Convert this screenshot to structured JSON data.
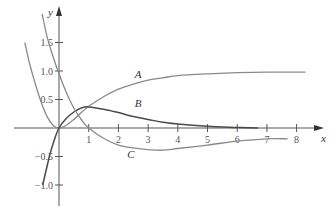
{
  "chart_data": {
    "type": "line",
    "title": "",
    "xlabel": "x",
    "ylabel": "y",
    "xlim": [
      -1.2,
      8.8
    ],
    "ylim": [
      -1.3,
      2.2
    ],
    "grid": false,
    "legend": "inline labels",
    "x_ticks": [
      1,
      2,
      3,
      4,
      5,
      6,
      7,
      8
    ],
    "x_tick_labels": [
      "1",
      "2",
      "3",
      "4",
      "5",
      "6",
      "7",
      "8"
    ],
    "y_ticks": [
      1.5,
      1.0,
      0.5,
      -0.5,
      -1.0
    ],
    "y_tick_labels": [
      "1.5",
      "1.0",
      "0.5",
      "−0.5",
      "−1.0"
    ],
    "series": [
      {
        "name": "A",
        "color": "#8a8a8a",
        "points": [
          [
            -1.15,
            1.5
          ],
          [
            -1.0,
            1.15
          ],
          [
            -0.8,
            0.78
          ],
          [
            -0.6,
            0.45
          ],
          [
            -0.4,
            0.2
          ],
          [
            -0.2,
            0.05
          ],
          [
            0,
            0
          ],
          [
            0.25,
            0.05
          ],
          [
            0.5,
            0.15
          ],
          [
            0.75,
            0.27
          ],
          [
            1,
            0.38
          ],
          [
            1.5,
            0.55
          ],
          [
            2,
            0.68
          ],
          [
            2.5,
            0.77
          ],
          [
            3,
            0.84
          ],
          [
            3.5,
            0.88
          ],
          [
            4,
            0.92
          ],
          [
            5,
            0.95
          ],
          [
            6,
            0.97
          ],
          [
            7,
            0.98
          ],
          [
            8.3,
            0.98
          ]
        ],
        "label_pos": [
          2.55,
          0.88
        ]
      },
      {
        "name": "B",
        "color": "#4a4a4a",
        "points": [
          [
            -0.55,
            -1.0
          ],
          [
            -0.45,
            -0.78
          ],
          [
            -0.3,
            -0.45
          ],
          [
            -0.15,
            -0.2
          ],
          [
            0,
            0
          ],
          [
            0.25,
            0.17
          ],
          [
            0.5,
            0.28
          ],
          [
            0.75,
            0.35
          ],
          [
            1,
            0.37
          ],
          [
            1.5,
            0.33
          ],
          [
            2,
            0.27
          ],
          [
            2.5,
            0.2
          ],
          [
            3,
            0.15
          ],
          [
            3.5,
            0.1
          ],
          [
            4,
            0.07
          ],
          [
            5,
            0.03
          ],
          [
            6,
            0.01
          ],
          [
            6.7,
            0.0
          ]
        ],
        "label_pos": [
          2.55,
          0.36
        ]
      },
      {
        "name": "C",
        "color": "#8a8a8a",
        "points": [
          [
            -0.57,
            2.0
          ],
          [
            -0.4,
            1.6
          ],
          [
            -0.2,
            1.25
          ],
          [
            0,
            0.95
          ],
          [
            0.25,
            0.62
          ],
          [
            0.5,
            0.35
          ],
          [
            0.75,
            0.15
          ],
          [
            1,
            0
          ],
          [
            1.5,
            -0.18
          ],
          [
            2,
            -0.3
          ],
          [
            2.5,
            -0.35
          ],
          [
            3,
            -0.38
          ],
          [
            3.5,
            -0.39
          ],
          [
            4,
            -0.36
          ],
          [
            5,
            -0.3
          ],
          [
            6,
            -0.23
          ],
          [
            7,
            -0.19
          ],
          [
            7.7,
            -0.19
          ]
        ],
        "label_pos": [
          2.3,
          -0.52
        ]
      }
    ]
  },
  "labels": {
    "x_axis": "x",
    "y_axis": "y",
    "curve_a": "A",
    "curve_b": "B",
    "curve_c": "C"
  }
}
